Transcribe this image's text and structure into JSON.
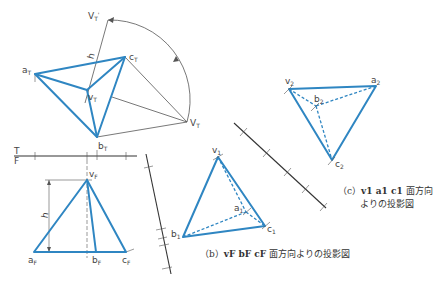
{
  "top_view": {
    "labels": {
      "aT": "a",
      "bT": "b",
      "cT": "c",
      "vT": "v",
      "VT": "V",
      "VTp": "V",
      "sub": "T",
      "prime": "'",
      "h": "h"
    }
  },
  "fold_line": {
    "top": "T",
    "bottom": "F"
  },
  "front_view": {
    "labels": {
      "vF": "v",
      "aF": "a",
      "bF": "b",
      "cF": "c",
      "sub": "F",
      "h": "h"
    }
  },
  "aux_view_1": {
    "labels": {
      "v1": "v",
      "a1": "a",
      "b1": "b",
      "c1": "c",
      "sub": "1"
    }
  },
  "aux_view_2": {
    "labels": {
      "v2": "v",
      "a2": "a",
      "b2": "b",
      "c2": "c",
      "sub": "2"
    }
  },
  "captions": {
    "b_prefix": "（b）",
    "b_vars": "vF bF cF",
    "b_text": "面方向よりの投影図",
    "c_prefix": "（c）",
    "c_vars": "v1 a1 c1",
    "c_text1": "面方向",
    "c_text2": "よりの投影図"
  },
  "colors": {
    "edge": "#2f86c2",
    "construction": "#555555"
  }
}
